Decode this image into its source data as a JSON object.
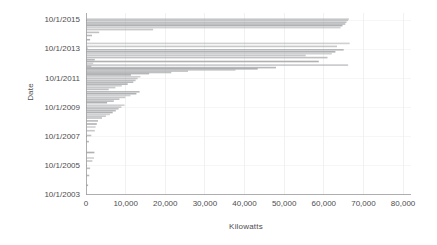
{
  "chart_data": {
    "type": "bar",
    "orientation": "horizontal",
    "title": "",
    "subtitle": "",
    "xlabel": "Kilowatts",
    "ylabel": "Date",
    "xlim": [
      0,
      82000
    ],
    "ylim": [
      "10/1/2003",
      "10/1/2016"
    ],
    "grid": true,
    "legend": null,
    "legend_position": "none",
    "bar_color": "#a7a9ac",
    "axis_color": "#9a9a9c",
    "grid_color": "#eceded",
    "text_color": "#4d4d4f",
    "background": "#ffffff",
    "xticks": [
      0,
      10000,
      20000,
      30000,
      40000,
      50000,
      60000,
      70000,
      80000
    ],
    "xtick_labels": [
      "0",
      "10,000",
      "20,000",
      "30,000",
      "40,000",
      "50,000",
      "60,000",
      "70,000",
      "80,000"
    ],
    "yticks": [
      "10/1/2003",
      "10/1/2005",
      "10/1/2007",
      "10/1/2009",
      "10/1/2011",
      "10/1/2013",
      "10/1/2015"
    ],
    "ytick_labels": [
      "10/1/2015",
      "10/1/2013",
      "10/1/2011",
      "10/1/2009",
      "10/1/2007",
      "10/1/2005",
      "10/1/2003"
    ],
    "note": "Each row is one project: a thin horizontal bar starting at 0 Kilowatts, plotted against its Date.",
    "categories": [
      "2015-11-01",
      "2015-10-01",
      "2015-08-15",
      "2015-07-01",
      "2015-05-20",
      "2015-04-01",
      "2015-02-10",
      "2014-12-01",
      "2014-09-15",
      "2014-06-01",
      "2014-03-01",
      "2013-12-15",
      "2013-11-01",
      "2013-09-20",
      "2013-08-01",
      "2013-06-15",
      "2013-05-01",
      "2013-03-10",
      "2013-01-15",
      "2012-12-01",
      "2012-10-15",
      "2012-09-01",
      "2012-08-01",
      "2012-07-01",
      "2012-06-01",
      "2012-05-01",
      "2012-04-01",
      "2012-03-01",
      "2012-02-01",
      "2012-01-01",
      "2011-11-15",
      "2011-10-01",
      "2011-08-15",
      "2011-07-01",
      "2011-05-15",
      "2011-04-01",
      "2011-02-15",
      "2011-01-01",
      "2010-11-01",
      "2010-09-15",
      "2010-08-01",
      "2010-06-15",
      "2010-05-01",
      "2010-03-15",
      "2010-02-01",
      "2009-12-01",
      "2009-10-15",
      "2009-09-01",
      "2009-07-15",
      "2009-06-01",
      "2009-04-15",
      "2009-03-01",
      "2009-01-15",
      "2008-11-01",
      "2008-08-15",
      "2008-06-01",
      "2008-03-01",
      "2007-11-01",
      "2007-06-01",
      "2006-09-01",
      "2006-04-15",
      "2006-02-01",
      "2005-08-01",
      "2005-02-01",
      "2004-06-01"
    ],
    "values": [
      66200,
      66000,
      65600,
      65300,
      64600,
      64100,
      16800,
      3200,
      1400,
      900,
      66400,
      63200,
      300,
      64900,
      62800,
      61900,
      55300,
      60800,
      2100,
      58600,
      1700,
      66000,
      1200,
      47800,
      43200,
      37600,
      25600,
      21400,
      15800,
      11200,
      13600,
      12900,
      12400,
      11800,
      10400,
      8900,
      7300,
      5600,
      13400,
      12600,
      11100,
      9800,
      8300,
      6900,
      5200,
      9600,
      8800,
      8100,
      7400,
      6600,
      5900,
      4900,
      3900,
      2900,
      2600,
      2300,
      2100,
      1200,
      600,
      2000,
      1900,
      1500,
      900,
      700,
      400
    ],
    "x_axis_range_px": [
      0,
      82000
    ],
    "bar_thickness": "thin"
  }
}
